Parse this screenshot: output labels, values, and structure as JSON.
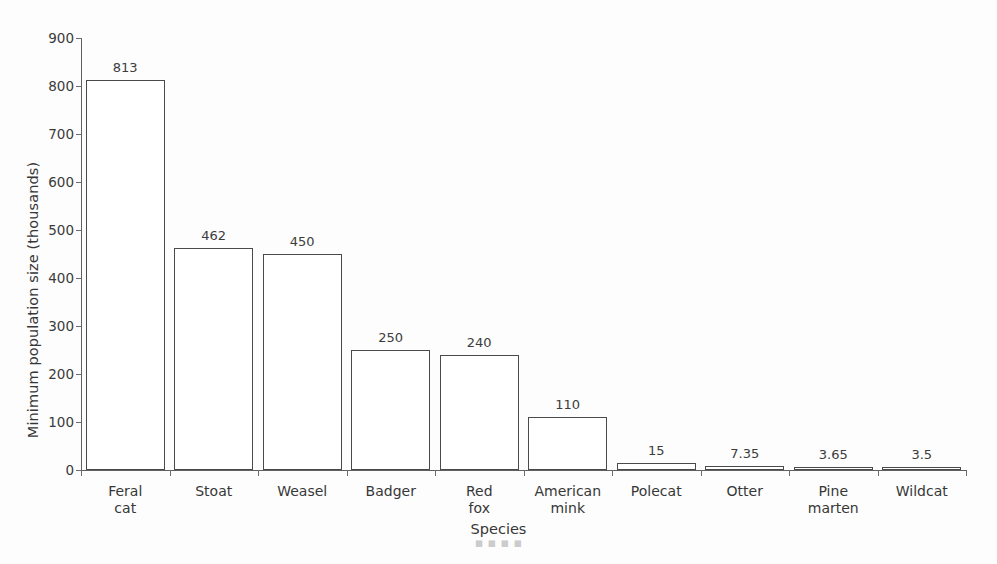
{
  "chart_data": {
    "type": "bar",
    "title": "",
    "subtitle": "",
    "xlabel": "Species",
    "ylabel": "Minimum population size (thousands)",
    "categories": [
      "Feral cat",
      "Stoat",
      "Weasel",
      "Badger",
      "Red fox",
      "American mink",
      "Polecat",
      "Otter",
      "Pine marten",
      "Wildcat"
    ],
    "values": [
      813,
      462,
      450,
      250,
      240,
      110,
      15,
      7.35,
      3.65,
      3.5
    ],
    "value_labels": [
      "813",
      "462",
      "450",
      "250",
      "240",
      "110",
      "15",
      "7.35",
      "3.65",
      "3.5"
    ],
    "ylim": [
      0,
      900
    ],
    "y_ticks": [
      0,
      100,
      200,
      300,
      400,
      500,
      600,
      700,
      800,
      900
    ],
    "y_tick_labels": [
      "0",
      "100",
      "200",
      "300",
      "400",
      "500",
      "600",
      "700",
      "800",
      "900"
    ],
    "grid": false,
    "legend": false,
    "legend_position": "none",
    "bar_fill_color": "#ffffff",
    "bar_edge_color": "#4a4a4a",
    "axis_color": "#5f5f5f",
    "text_color": "#373737",
    "background_color": "#ffffff"
  },
  "artifact": {
    "bottom_text": "▪ ▪ ▪ ▪"
  }
}
